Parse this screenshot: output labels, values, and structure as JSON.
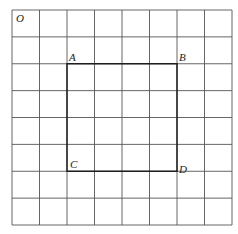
{
  "diagram": {
    "grid": {
      "cols": 8,
      "rows": 8,
      "x0": 12,
      "y0": 10,
      "width": 220,
      "height": 215,
      "line_color": "#555555"
    },
    "square": {
      "vertices": [
        "A",
        "B",
        "D",
        "C"
      ],
      "cells": {
        "col_start": 2,
        "col_end": 6,
        "row_start": 2,
        "row_end": 6
      },
      "color": "#1a1a1a"
    },
    "labels": {
      "origin": "O",
      "A": "A",
      "B": "B",
      "C": "C",
      "D": "D"
    }
  }
}
